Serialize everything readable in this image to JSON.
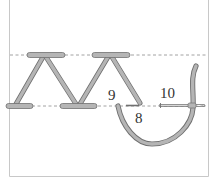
{
  "diagram": {
    "type": "embroidery-stitch-diagram",
    "colors": {
      "thread_fill": "#b5b5b5",
      "thread_stroke": "#707070",
      "guide_line": "#8a8a8a",
      "frame": "#c8c8c8",
      "label": "#333333",
      "needle": "#9a9a9a"
    },
    "labels": {
      "point_8": "8",
      "point_9": "9",
      "point_10": "10"
    },
    "guide_lines": [
      {
        "name": "upper-guide-line",
        "y": 55
      },
      {
        "name": "lower-guide-line",
        "y": 106
      }
    ]
  }
}
